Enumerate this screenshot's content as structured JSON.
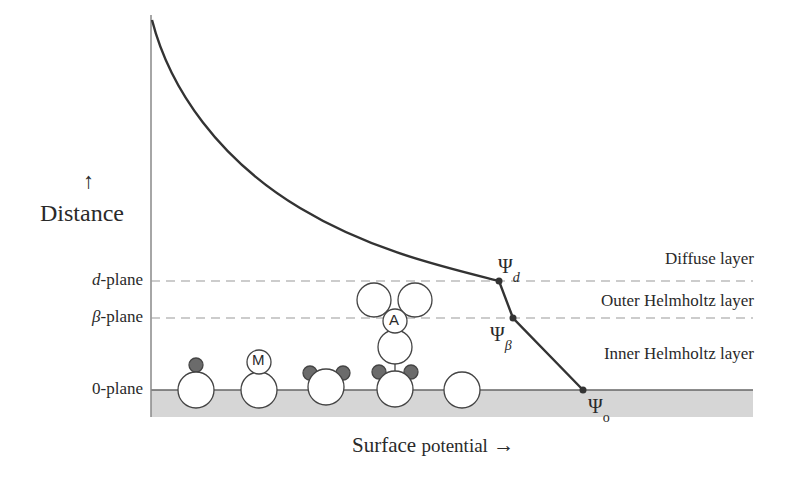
{
  "diagram": {
    "y_axis": {
      "arrow": "↑",
      "label": "Distance"
    },
    "x_axis": {
      "label_main": "Surface",
      "label_rest": "potential",
      "arrow": "→"
    },
    "planes": [
      {
        "prefix": "d",
        "suffix": "-plane",
        "y": 281
      },
      {
        "prefix": "β",
        "suffix": "-plane",
        "y": 318
      },
      {
        "prefix": "",
        "suffix": "0-plane",
        "y": 390
      }
    ],
    "layers": [
      {
        "label": "Diffuse layer"
      },
      {
        "label": "Outer Helmholtz layer"
      },
      {
        "label": "Inner Helmholtz layer"
      }
    ],
    "potentials": [
      {
        "symbol": "Ψ",
        "sub": "d",
        "x": 499,
        "y": 281
      },
      {
        "symbol": "Ψ",
        "sub": "β",
        "x": 513,
        "y": 318
      },
      {
        "symbol": "Ψ",
        "sub": "o",
        "x": 583,
        "y": 390
      }
    ],
    "species": [
      {
        "id": "M",
        "label": "M"
      },
      {
        "id": "A",
        "label": "A"
      }
    ],
    "colors": {
      "line": "#333333",
      "dashed": "#999999",
      "surface_fill": "#d6d6d6",
      "adsorbed_dot": "#6b6b6b"
    }
  }
}
